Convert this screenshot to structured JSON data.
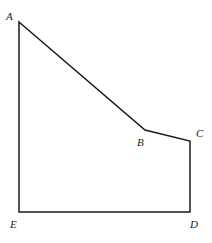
{
  "figure": {
    "name": "pentagon-abcde",
    "kind": "geometry-diagram",
    "background_color": "#ffffff",
    "stroke_color": "#1a1a1a",
    "stroke_width": 1.5,
    "fill": "none",
    "canvas": {
      "width": 212,
      "height": 243
    },
    "polygon_path": "M 19 22 L 145 130 L 190 141 L 190 212 L 19 212 Z",
    "vertices": [
      {
        "id": "A",
        "label": "A",
        "x": 19,
        "y": 22,
        "label_x": 6,
        "label_y": 11
      },
      {
        "id": "B",
        "label": "B",
        "x": 145,
        "y": 130,
        "label_x": 137,
        "label_y": 137
      },
      {
        "id": "C",
        "label": "C",
        "x": 190,
        "y": 141,
        "label_x": 196,
        "label_y": 128
      },
      {
        "id": "D",
        "label": "D",
        "x": 190,
        "y": 212,
        "label_x": 190,
        "label_y": 219
      },
      {
        "id": "E",
        "label": "E",
        "x": 19,
        "y": 212,
        "label_x": 10,
        "label_y": 219
      }
    ],
    "edges": [
      {
        "id": "AB",
        "from": "A",
        "to": "B",
        "orientation": "diagonal-descending"
      },
      {
        "id": "BC",
        "from": "B",
        "to": "C",
        "orientation": "shallow-descending"
      },
      {
        "id": "CD",
        "from": "C",
        "to": "D",
        "orientation": "vertical"
      },
      {
        "id": "DE",
        "from": "D",
        "to": "E",
        "orientation": "horizontal"
      },
      {
        "id": "EA",
        "from": "E",
        "to": "A",
        "orientation": "vertical"
      }
    ]
  }
}
